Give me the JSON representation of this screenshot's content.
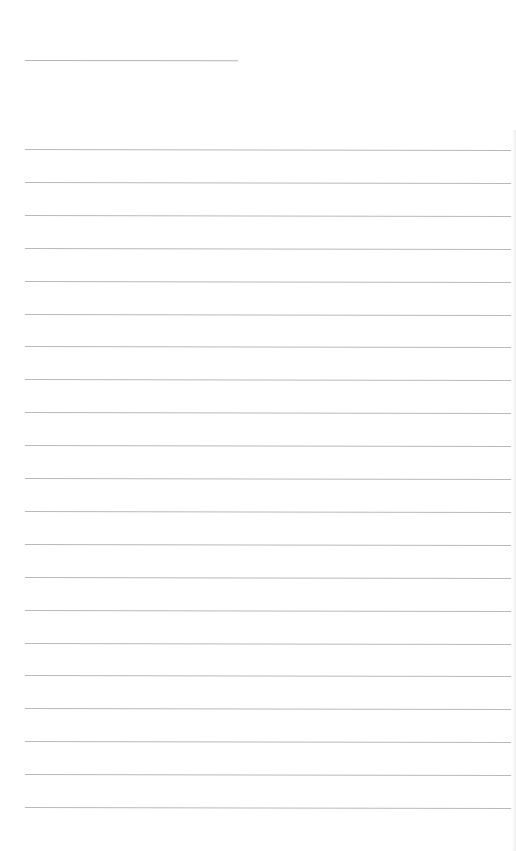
{
  "document": {
    "type": "lined-writing-paper",
    "background_color": "#ffffff",
    "line_color": "#b9b9b9",
    "header_line": {
      "left": 25,
      "top": 60,
      "width": 213
    },
    "rules": {
      "count": 21,
      "left": 25,
      "width": 486,
      "first_top": 149,
      "spacing": 32.9
    },
    "text_content": ""
  }
}
